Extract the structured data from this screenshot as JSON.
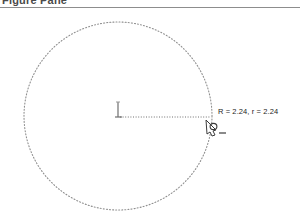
{
  "window": {
    "title": "Figure Pane"
  },
  "canvas": {
    "background_color": "#ffffff",
    "stroke_color": "#8f8f8f",
    "label_color": "#1d1d1d"
  },
  "shape": {
    "type": "circle",
    "center_x": 118,
    "center_y": 116,
    "radius_px": 94,
    "stroke_style": "dotted"
  },
  "center_marker": {
    "name": "origin-axis-marker",
    "tick_height_px": 14,
    "radius_line_style": "dotted"
  },
  "cursor": {
    "name": "pen-cursor",
    "x": 211,
    "y": 117
  },
  "annotations": {
    "radius_label": "R = 2.24, r = 2.24",
    "radius_label_x": 218,
    "radius_label_y": 107
  }
}
